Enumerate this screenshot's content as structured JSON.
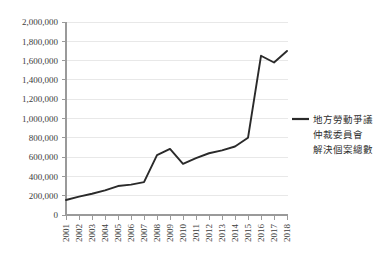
{
  "chart_data": {
    "type": "line",
    "title": "",
    "xlabel": "",
    "ylabel": "",
    "grid": "horizontal",
    "legend_position": "right",
    "ylim": [
      0,
      2000000
    ],
    "ytick_labels": [
      "2,000,000",
      "1,800,000",
      "1,600,000",
      "1,400,000",
      "1,200,000",
      "1,000,000",
      "800,000",
      "600,000",
      "400,000",
      "200,000",
      "0"
    ],
    "ytick_values": [
      2000000,
      1800000,
      1600000,
      1400000,
      1200000,
      1000000,
      800000,
      600000,
      400000,
      200000,
      0
    ],
    "categories": [
      "2001",
      "2002",
      "2003",
      "2004",
      "2005",
      "2006",
      "2007",
      "2008",
      "2009",
      "2010",
      "2011",
      "2012",
      "2013",
      "2014",
      "2015",
      "2016",
      "2017",
      "2018"
    ],
    "series": [
      {
        "name": "地方勞動爭議仲裁委員會解決個案總數",
        "color": "#2a2a2a",
        "values": [
          155000,
          190000,
          220000,
          255000,
          300000,
          315000,
          340000,
          620000,
          685000,
          530000,
          590000,
          640000,
          670000,
          710000,
          800000,
          1650000,
          1580000,
          1700000
        ]
      }
    ]
  },
  "legend": {
    "entries": [
      {
        "swatch_color": "#2a2a2a",
        "lines": [
          "地方勞動爭議",
          "仲裁委員會",
          "解決個案總數"
        ]
      }
    ]
  }
}
